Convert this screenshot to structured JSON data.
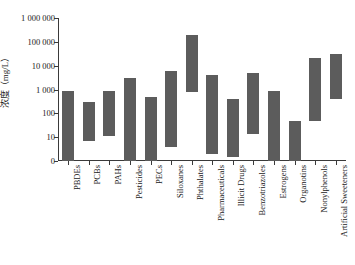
{
  "chart_data": {
    "type": "bar",
    "subtype": "floating-range-bar",
    "title": "",
    "xlabel": "",
    "ylabel": "浓度（mg/L）",
    "yscale": "log",
    "ylim": [
      1,
      1000000
    ],
    "grid": false,
    "legend": null,
    "ytick_labels": [
      "1 000 000",
      "100 000",
      "10 000",
      "1 000",
      "100",
      "10",
      "0"
    ],
    "ytick_values": [
      1000000,
      100000,
      10000,
      1000,
      100,
      10,
      1
    ],
    "categories": [
      "PBDEs",
      "PCBs",
      "PAHs",
      "Pesticides",
      "PECs",
      "Siloxanes",
      "Phthalates",
      "Pharmaceuticals",
      "Illicit Drugs",
      "Benzotriazoles",
      "Estrogens",
      "Organotins",
      "Nonylphenols",
      "Artificial Sweeteners"
    ],
    "low": [
      1,
      7,
      11,
      1,
      1,
      4,
      800,
      2,
      1.5,
      14,
      1,
      1,
      50,
      400
    ],
    "high": [
      900,
      300,
      900,
      3000,
      500,
      6000,
      200000,
      4000,
      400,
      5000,
      900,
      50,
      20000,
      30000
    ],
    "bar_color": "#5c5c5c",
    "axis_color": "#3a3a3a",
    "background": "#ffffff"
  }
}
